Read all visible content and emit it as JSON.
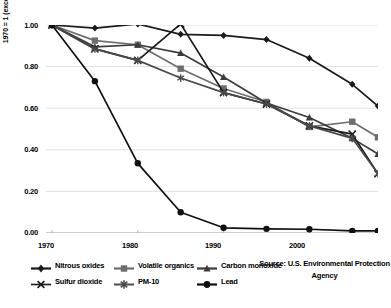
{
  "chart_data": {
    "type": "line",
    "title": "",
    "xlabel": "",
    "ylabel": "1970 = 1 (except PM-10)",
    "xlim": [
      1970,
      2008
    ],
    "ylim": [
      0.0,
      1.0
    ],
    "grid": true,
    "gridlines": "horizontal",
    "legend_position": "bottom",
    "x": [
      1970,
      1975,
      1980,
      1985,
      1990,
      1995,
      2000,
      2005,
      2008
    ],
    "xticks": [
      "1970",
      "1980",
      "1990",
      "2000"
    ],
    "xtick_values": [
      1970,
      1980,
      1990,
      2000
    ],
    "yticks": [
      "0.00",
      "0.20",
      "0.40",
      "0.60",
      "0.80",
      "1.00"
    ],
    "ytick_values": [
      0.0,
      0.2,
      0.4,
      0.6,
      0.8,
      1.0
    ],
    "series": [
      {
        "name": "Nitrous oxides",
        "marker": "diamond",
        "color": "#1a1a1a",
        "values": [
          1.0,
          0.985,
          1.005,
          0.955,
          0.95,
          0.93,
          0.84,
          0.715,
          0.61
        ]
      },
      {
        "name": "Volatile organics",
        "marker": "square",
        "color": "#6e6e6e",
        "values": [
          1.0,
          0.925,
          0.905,
          0.79,
          0.695,
          0.63,
          0.51,
          0.535,
          0.46
        ]
      },
      {
        "name": "Carbon monoxide",
        "marker": "triangle",
        "color": "#3c3c3c",
        "values": [
          1.0,
          0.895,
          0.905,
          0.865,
          0.75,
          0.625,
          0.555,
          0.455,
          0.38
        ]
      },
      {
        "name": "Sulfur dioxide",
        "marker": "x",
        "color": "#1a1a1a",
        "values": [
          1.0,
          0.885,
          0.83,
          1.005,
          0.675,
          0.62,
          0.515,
          0.475,
          0.285
        ]
      },
      {
        "name": "PM-10",
        "marker": "asterisk",
        "color": "#4a4a4a",
        "values": [
          1.0,
          0.885,
          0.83,
          0.745,
          0.675,
          0.62,
          0.515,
          0.455,
          0.285
        ]
      },
      {
        "name": "Lead",
        "marker": "circle",
        "color": "#101010",
        "values": [
          1.0,
          0.73,
          0.335,
          0.1,
          0.025,
          0.02,
          0.018,
          0.01,
          0.01
        ]
      }
    ],
    "source_note": "Source: U.S. Environmental Protection Agency"
  }
}
